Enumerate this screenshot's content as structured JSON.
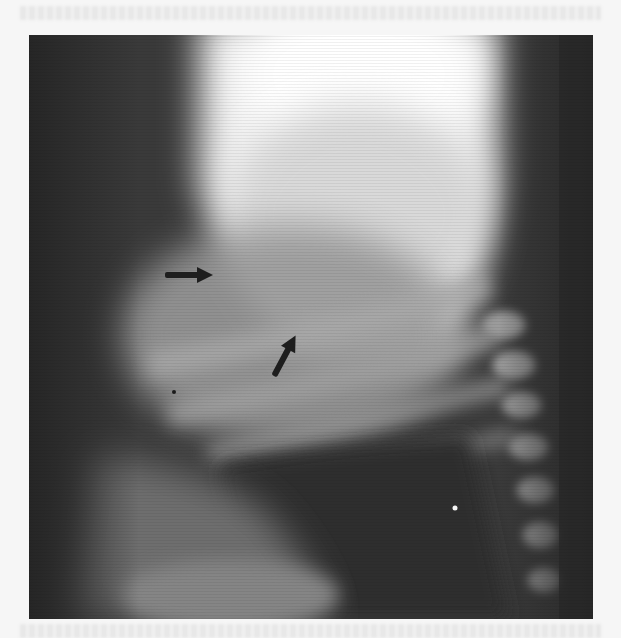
{
  "figure": {
    "type": "lateral chest radiograph",
    "position": {
      "x": 29,
      "y": 35,
      "width": 564,
      "height": 584
    },
    "annotations": [
      {
        "kind": "arrow",
        "direction": "right",
        "from": [
          165,
          275
        ],
        "to": [
          212,
          275
        ],
        "color": "#1e1e1e"
      },
      {
        "kind": "arrow",
        "direction": "up-right",
        "from": [
          264,
          396
        ],
        "to": [
          284,
          357
        ],
        "color": "#1e1e1e"
      },
      {
        "kind": "dot",
        "at": [
          174,
          392
        ],
        "color": "#1a1a1a"
      },
      {
        "kind": "dot",
        "at": [
          455,
          508
        ],
        "color": "#f4f4f4"
      }
    ]
  },
  "colors": {
    "page_background": "#f6f6f6",
    "film_dark": "#2e2e2e",
    "film_bright": "#fbfbfb"
  }
}
